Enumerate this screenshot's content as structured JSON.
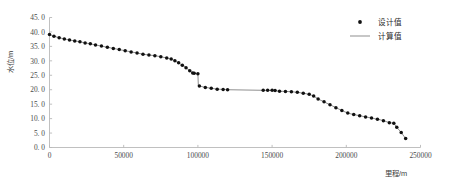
{
  "chart_data": {
    "type": "line",
    "title": "",
    "xlabel": "里程/m",
    "ylabel": "水位/m",
    "xlim": [
      0,
      250000
    ],
    "ylim": [
      0,
      45
    ],
    "xticks": [
      0,
      50000,
      100000,
      150000,
      200000,
      250000
    ],
    "xticklabels": [
      "0",
      "50000",
      "100000",
      "150000",
      "200000",
      "250000"
    ],
    "yticks": [
      0,
      5,
      10,
      15,
      20,
      25,
      30,
      35,
      40,
      45
    ],
    "yticklabels": [
      "0. 0",
      "5. 0",
      "10. 0",
      "15. 0",
      "20. 0",
      "25. 0",
      "30. 0",
      "35. 0",
      "40. 0",
      "45. 0"
    ],
    "grid": false,
    "legend_position": "top-right",
    "legend": [
      "设计值",
      "计算值"
    ],
    "series": [
      {
        "name": "设计值",
        "style": "marker",
        "marker": "circle",
        "color": "#111111",
        "x": [
          0,
          3000,
          6500,
          10000,
          13500,
          17000,
          20500,
          24000,
          27500,
          31000,
          35000,
          39000,
          43000,
          47000,
          51000,
          55000,
          59000,
          63000,
          67000,
          71000,
          75000,
          79000,
          82000,
          84500,
          87000,
          89500,
          92000,
          94500,
          96500,
          97500,
          100000,
          101000,
          105000,
          109000,
          113000,
          117000,
          120000,
          144000,
          147000,
          150000,
          152000,
          155000,
          159000,
          163000,
          167000,
          171000,
          175000,
          178000,
          181000,
          185000,
          189000,
          193000,
          197000,
          201000,
          205000,
          209000,
          213000,
          217000,
          221000,
          225000,
          229000,
          232000,
          234000,
          237000,
          240000
        ],
        "y": [
          39.1,
          38.5,
          38.0,
          37.6,
          37.2,
          36.9,
          36.6,
          36.2,
          35.9,
          35.5,
          35.1,
          34.7,
          34.3,
          33.9,
          33.5,
          33.1,
          32.7,
          32.3,
          32.0,
          31.8,
          31.4,
          31.0,
          30.6,
          30.0,
          29.3,
          28.5,
          27.6,
          26.6,
          25.8,
          25.7,
          25.5,
          21.3,
          20.8,
          20.5,
          20.2,
          20.1,
          20.0,
          19.8,
          19.8,
          19.8,
          19.7,
          19.5,
          19.4,
          19.3,
          19.1,
          18.8,
          18.4,
          17.8,
          16.8,
          15.8,
          14.8,
          13.8,
          12.8,
          11.9,
          11.4,
          11.0,
          10.6,
          10.2,
          9.8,
          9.3,
          8.6,
          8.4,
          7.0,
          5.2,
          3.1
        ]
      },
      {
        "name": "计算值",
        "style": "line",
        "color": "#8f8f8f",
        "x": [
          0,
          3000,
          6500,
          10000,
          13500,
          17000,
          20500,
          24000,
          27500,
          31000,
          35000,
          39000,
          43000,
          47000,
          51000,
          55000,
          59000,
          63000,
          67000,
          71000,
          75000,
          79000,
          82000,
          84500,
          87000,
          89500,
          92000,
          94500,
          96500,
          97500,
          100000,
          100300,
          101000,
          105000,
          109000,
          113000,
          117000,
          120000,
          144000,
          147000,
          150000,
          152000,
          155000,
          159000,
          163000,
          167000,
          171000,
          175000,
          178000,
          181000,
          185000,
          189000,
          193000,
          197000,
          201000,
          205000,
          209000,
          213000,
          217000,
          221000,
          225000,
          229000,
          232000,
          234000,
          237000,
          240000
        ],
        "y": [
          39.1,
          38.5,
          38.0,
          37.6,
          37.2,
          36.9,
          36.6,
          36.2,
          35.9,
          35.5,
          35.1,
          34.7,
          34.3,
          33.9,
          33.5,
          33.1,
          32.7,
          32.3,
          32.0,
          31.8,
          31.4,
          31.0,
          30.6,
          30.0,
          29.3,
          28.5,
          27.6,
          26.6,
          25.8,
          25.7,
          25.5,
          21.3,
          21.3,
          20.8,
          20.5,
          20.2,
          20.1,
          20.0,
          19.8,
          19.8,
          19.8,
          19.7,
          19.5,
          19.4,
          19.3,
          19.1,
          18.8,
          18.4,
          17.8,
          16.8,
          15.8,
          14.8,
          13.8,
          12.8,
          11.9,
          11.4,
          11.0,
          10.6,
          10.2,
          9.8,
          9.3,
          8.6,
          8.4,
          7.0,
          5.2,
          3.1
        ]
      }
    ]
  },
  "axes": {
    "x_title": "里程/m",
    "y_title": "水位/m"
  },
  "legend": {
    "items": [
      {
        "label": "设计值",
        "type": "marker"
      },
      {
        "label": "计算值",
        "type": "line"
      }
    ]
  }
}
